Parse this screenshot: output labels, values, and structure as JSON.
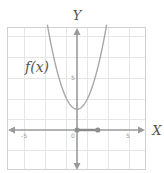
{
  "chart_data": {
    "type": "line",
    "title": "",
    "xlabel": "X",
    "ylabel": "Y",
    "function_label": "f(x)",
    "function": "x^2 + 2",
    "xlim": [
      -7,
      7
    ],
    "ylim": [
      -4,
      10
    ],
    "x_ticks": [
      "-5",
      "0",
      "5"
    ],
    "y_ticks": [
      "5"
    ],
    "grid": true,
    "series": [
      {
        "name": "f(x)",
        "x": [
          -2.8,
          -2,
          -1,
          0,
          1,
          2,
          2.8
        ],
        "y": [
          9.84,
          6,
          3,
          2,
          3,
          6,
          9.84
        ]
      }
    ],
    "points": [
      {
        "x": 0,
        "y": 0
      },
      {
        "x": 2,
        "y": 0
      }
    ],
    "segment": {
      "from": [
        0,
        0
      ],
      "to": [
        2,
        0
      ]
    },
    "colors": {
      "curve": "#a8a8a8",
      "axis": "#9a9a9a",
      "grid": "#e6e6e6"
    }
  },
  "labels": {
    "x_axis": "X",
    "y_axis": "Y",
    "function": "f(x)",
    "tick_neg5": "-5",
    "tick_0": "0",
    "tick_5x": "5",
    "tick_5y": "5"
  }
}
